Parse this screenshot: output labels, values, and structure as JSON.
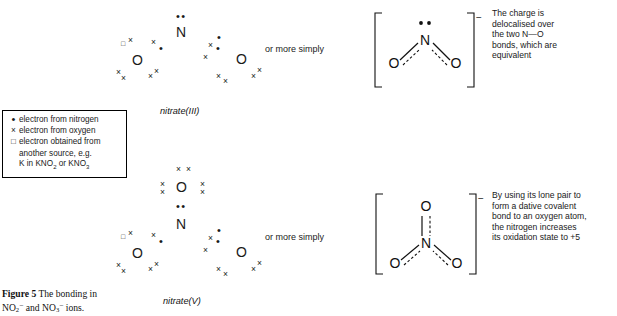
{
  "figure": {
    "caption_label": "Figure 5",
    "caption_text": "The bonding in",
    "caption_line2_pre": "NO",
    "caption_line2_sub1": "2",
    "caption_line2_sup1": "−",
    "caption_line2_mid": " and NO",
    "caption_line2_sub2": "3",
    "caption_line2_sup2": "−",
    "caption_line2_end": " ions."
  },
  "legend": {
    "rows": [
      {
        "symbol": "•",
        "symbol_name": "filled-dot",
        "text": "electron from nitrogen"
      },
      {
        "symbol": "×",
        "symbol_name": "cross",
        "text": "electron from oxygen"
      },
      {
        "symbol": "□",
        "symbol_name": "open-square",
        "text": "electron obtained from"
      }
    ],
    "continuation_line1": "another source, e.g.",
    "continuation_line2_pre": "K in KNO",
    "continuation_sub1": "2",
    "continuation_line2_mid": " or KNO",
    "continuation_sub2": "3"
  },
  "structures": [
    {
      "id": "nitrate-iii",
      "label": "nitrate(III)",
      "connector": "or more simply",
      "central_atom": "N",
      "oxygen_atoms": [
        "O",
        "O"
      ],
      "lone_pair_on_n": "••",
      "charge": "−",
      "note": "The charge is delocalised over the two N—O bonds, which are equivalent",
      "note_lines": [
        "The charge is",
        "delocalised over",
        "the two N—O",
        "bonds, which are",
        "equivalent"
      ]
    },
    {
      "id": "nitrate-v",
      "label": "nitrate(V)",
      "connector": "or more simply",
      "central_atom": "N",
      "oxygen_atoms": [
        "O",
        "O",
        "O"
      ],
      "dative_oxygen": "O",
      "lone_pair_on_n": "••",
      "charge": "−",
      "note": "By using its lone pair to form a dative covalent bond to an oxygen atom, the nitrogen increases its oxidation state to +5",
      "note_lines": [
        "By using its lone pair to",
        "form a dative covalent",
        "bond to an oxygen atom,",
        "the nitrogen increases",
        "its oxidation state to +5"
      ]
    }
  ],
  "symbols": {
    "dot": "•",
    "cross": "×",
    "square": "□",
    "dot_pair": "••",
    "cross_pair": "× ×",
    "minus": "−"
  },
  "colors": {
    "ink": "#1a1a1a",
    "background": "#ffffff",
    "bond": "#111111"
  }
}
